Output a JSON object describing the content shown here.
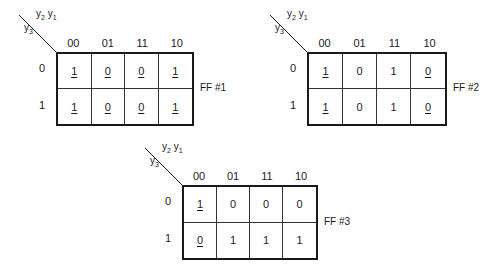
{
  "column_headers": [
    "00",
    "01",
    "11",
    "10"
  ],
  "row_headers": [
    "0",
    "1"
  ],
  "column_var_label": {
    "a": "y",
    "a_sub": "2",
    "b": "y",
    "b_sub": "1"
  },
  "row_var_label": {
    "a": "y",
    "a_sub": "3"
  },
  "maps": [
    {
      "label": "FF #1",
      "cells": [
        [
          {
            "v": "1",
            "u": true
          },
          {
            "v": "0",
            "u": true
          },
          {
            "v": "0",
            "u": true
          },
          {
            "v": "1",
            "u": true
          }
        ],
        [
          {
            "v": "1",
            "u": true
          },
          {
            "v": "0",
            "u": true
          },
          {
            "v": "0",
            "u": true
          },
          {
            "v": "1",
            "u": true
          }
        ]
      ]
    },
    {
      "label": "FF #2",
      "cells": [
        [
          {
            "v": "1",
            "u": true
          },
          {
            "v": "0",
            "u": false
          },
          {
            "v": "1",
            "u": false
          },
          {
            "v": "0",
            "u": true
          }
        ],
        [
          {
            "v": "1",
            "u": true
          },
          {
            "v": "0",
            "u": false
          },
          {
            "v": "1",
            "u": false
          },
          {
            "v": "0",
            "u": true
          }
        ]
      ]
    },
    {
      "label": "FF #3",
      "cells": [
        [
          {
            "v": "1",
            "u": true
          },
          {
            "v": "0",
            "u": false
          },
          {
            "v": "0",
            "u": false
          },
          {
            "v": "0",
            "u": false
          }
        ],
        [
          {
            "v": "0",
            "u": true
          },
          {
            "v": "1",
            "u": false
          },
          {
            "v": "1",
            "u": false
          },
          {
            "v": "1",
            "u": false
          }
        ]
      ]
    }
  ]
}
